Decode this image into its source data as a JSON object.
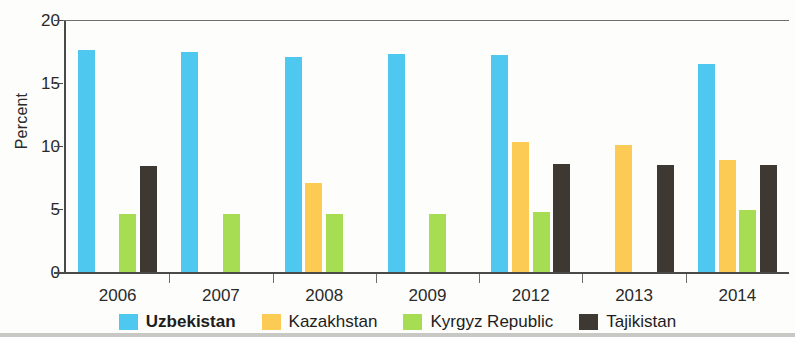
{
  "chart_data": {
    "type": "bar",
    "title": "",
    "subtitle": "",
    "xlabel": "",
    "ylabel": "Percent",
    "categories": [
      "2006",
      "2007",
      "2008",
      "2009",
      "2012",
      "2013",
      "2014"
    ],
    "ylim": [
      0,
      20
    ],
    "yticks": [
      0,
      5,
      10,
      15,
      20
    ],
    "ytick_labels": [
      "0",
      "5",
      "10",
      "15",
      "20"
    ],
    "grid": false,
    "legend_position": "bottom",
    "series": [
      {
        "name": "Uzbekistan",
        "color": "#4ec8ee",
        "emphasis": true,
        "values": [
          17.6,
          17.5,
          17.1,
          17.3,
          17.2,
          null,
          16.5
        ]
      },
      {
        "name": "Kazakhstan",
        "color": "#fbcb54",
        "emphasis": false,
        "values": [
          null,
          null,
          7.1,
          null,
          10.3,
          10.1,
          8.9
        ]
      },
      {
        "name": "Kyrgyz Republic",
        "color": "#a6dd53",
        "emphasis": false,
        "values": [
          4.6,
          4.6,
          4.6,
          4.6,
          4.8,
          null,
          4.9
        ]
      },
      {
        "name": "Tajikistan",
        "color": "#3e3833",
        "emphasis": false,
        "values": [
          8.4,
          null,
          null,
          null,
          8.6,
          8.5,
          8.5
        ]
      }
    ]
  },
  "axis": {
    "y_title": "Percent"
  }
}
